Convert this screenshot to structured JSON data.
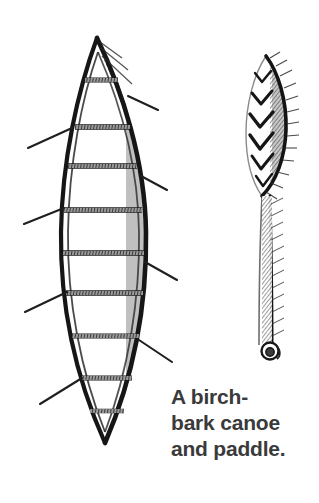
{
  "page": {
    "width": 319,
    "height": 503,
    "background_color": "#ffffff",
    "medium": "pen-and-ink line drawing"
  },
  "caption": {
    "full_text": "A birch-bark canoe and paddle.",
    "lines": [
      "A birch-",
      "bark canoe",
      "and paddle."
    ],
    "color": "#3a3a3a",
    "weight": "bold"
  },
  "illustration": {
    "ink_color": "#1a1a1a",
    "shade_color": "#555555",
    "figures": [
      {
        "name": "canoe",
        "label": "birch-bark canoe",
        "view": "top-down / plan view",
        "thwart_count": 9,
        "rib_stick_count_left": 4,
        "rib_stick_count_right": 4,
        "bow_tip": {
          "x": 97,
          "y": 38
        },
        "stern_tip": {
          "x": 105,
          "y": 443
        },
        "widest_span": {
          "x_left": 60,
          "x_right": 146,
          "y": 230
        }
      },
      {
        "name": "paddle",
        "label": "paddle",
        "blade_top": {
          "x": 266,
          "y": 56
        },
        "grip_knob": {
          "x": 272,
          "y": 351,
          "radius": 8
        },
        "chevron_count": 6
      }
    ]
  }
}
